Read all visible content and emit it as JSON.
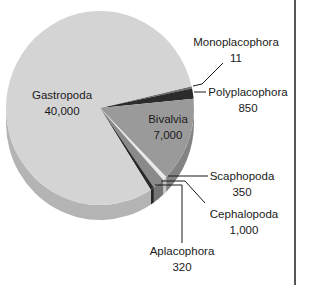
{
  "chart_data": {
    "type": "pie",
    "title": "",
    "style": "3d-pie",
    "total": 49531,
    "slices": [
      {
        "label": "Monoplacophora",
        "value": 11,
        "display": "11",
        "color": "#6e6e6e"
      },
      {
        "label": "Polyplacophora",
        "value": 850,
        "display": "850",
        "color": "#2b2b2b"
      },
      {
        "label": "Bivalvia",
        "value": 7000,
        "display": "7,000",
        "color": "#9a9a9a"
      },
      {
        "label": "Scaphopoda",
        "value": 350,
        "display": "350",
        "color": "#e8e8e8"
      },
      {
        "label": "Cephalopoda",
        "value": 1000,
        "display": "1,000",
        "color": "#8a8a8a"
      },
      {
        "label": "Aplacophora",
        "value": 320,
        "display": "320",
        "color": "#2b2b2b"
      },
      {
        "label": "Gastropoda",
        "value": 40000,
        "display": "40,000",
        "color": "#d4d4d4"
      }
    ],
    "start_angle_deg": -13,
    "legend": "none (callout labels)"
  },
  "labels": {
    "gastropoda": {
      "name": "Gastropoda",
      "value": "40,000"
    },
    "bivalvia": {
      "name": "Bivalvia",
      "value": "7,000"
    },
    "monoplacophora": {
      "name": "Monoplacophora",
      "value": "11"
    },
    "polyplacophora": {
      "name": "Polyplacophora",
      "value": "850"
    },
    "scaphopoda": {
      "name": "Scaphopoda",
      "value": "350"
    },
    "cephalopoda": {
      "name": "Cephalopoda",
      "value": "1,000"
    },
    "aplacophora": {
      "name": "Aplacophora",
      "value": "320"
    }
  }
}
